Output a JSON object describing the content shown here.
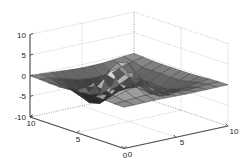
{
  "figure": {
    "title": "",
    "background_color": "#ffffff",
    "axis_color": "#4d4d4d",
    "grid_color": "#9a9a9a",
    "mesh_color": "#3a3a3a",
    "tick_font_size": 8
  },
  "chart_data": {
    "type": "surface",
    "title": "",
    "xlabel": "",
    "ylabel": "",
    "zlabel": "",
    "function": "peaks",
    "grid_n": 11,
    "xlim": [
      0,
      10
    ],
    "ylim": [
      0,
      10
    ],
    "zlim": [
      -10,
      10
    ],
    "xticks": [
      0,
      5,
      10
    ],
    "yticks": [
      0,
      5,
      10
    ],
    "zticks": [
      -10,
      -5,
      0,
      5,
      10
    ],
    "xtick_labels": [
      "0",
      "5",
      "10"
    ],
    "ytick_labels": [
      "10",
      "5",
      "0"
    ],
    "ztick_labels": [
      "10",
      "5",
      "0",
      "-5",
      "-10"
    ],
    "grid": true,
    "legend": null,
    "colormap": "gray",
    "view_azimuth": -37.5,
    "view_elevation": 30,
    "x": [
      0,
      1,
      2,
      3,
      4,
      5,
      6,
      7,
      8,
      9,
      10
    ],
    "y": [
      0,
      1,
      2,
      3,
      4,
      5,
      6,
      7,
      8,
      9,
      10
    ],
    "z": [
      [
        0.01,
        0.03,
        0.07,
        0.1,
        0.07,
        0.0,
        -0.06,
        -0.07,
        -0.05,
        -0.02,
        -0.01
      ],
      [
        0.05,
        0.17,
        0.39,
        0.53,
        0.37,
        0.01,
        -0.31,
        -0.39,
        -0.26,
        -0.11,
        -0.03
      ],
      [
        0.17,
        0.58,
        1.35,
        1.9,
        1.38,
        0.09,
        -1.06,
        -1.38,
        -0.94,
        -0.4,
        -0.12
      ],
      [
        0.33,
        1.19,
        2.97,
        4.52,
        3.6,
        0.53,
        -2.26,
        -3.16,
        -2.22,
        -0.96,
        -0.29
      ],
      [
        0.36,
        1.37,
        3.7,
        6.21,
        5.53,
        1.33,
        -2.74,
        -4.15,
        -3.02,
        -1.33,
        -0.4
      ],
      [
        0.13,
        0.53,
        1.63,
        3.18,
        3.33,
        0.64,
        -2.6,
        -4.2,
        -3.19,
        -1.43,
        -0.44
      ],
      [
        -0.2,
        -0.8,
        -2.25,
        -3.57,
        -3.12,
        -1.68,
        -2.18,
        -3.49,
        -2.81,
        -1.3,
        -0.4
      ],
      [
        -0.34,
        -1.33,
        -3.53,
        -5.88,
        -6.62,
        -5.52,
        -4.56,
        -4.43,
        -3.05,
        -1.35,
        -0.41
      ],
      [
        -0.24,
        -0.92,
        -2.43,
        -4.16,
        -5.24,
        -5.43,
        -5.05,
        -4.43,
        -2.91,
        -1.27,
        -0.38
      ],
      [
        -0.1,
        -0.37,
        -0.98,
        -1.72,
        -2.3,
        -2.57,
        -2.53,
        -2.28,
        -1.52,
        -0.66,
        -0.2
      ],
      [
        -0.03,
        -0.1,
        -0.28,
        -0.5,
        -0.69,
        -0.8,
        -0.81,
        -0.74,
        -0.5,
        -0.22,
        -0.07
      ]
    ],
    "zmin": -6.62,
    "zmax": 6.21,
    "peak_high_value": 6.21,
    "peak_low_value": -6.62
  },
  "axes": {
    "z_ticks": [
      {
        "label": "10",
        "value": 10
      },
      {
        "label": "5",
        "value": 5
      },
      {
        "label": "0",
        "value": 0
      },
      {
        "label": "-5",
        "value": -5
      },
      {
        "label": "-10",
        "value": -10
      }
    ],
    "y_ticks": [
      {
        "label": "10",
        "value": 10
      },
      {
        "label": "5",
        "value": 5
      },
      {
        "label": "0",
        "value": 0
      }
    ],
    "x_ticks": [
      {
        "label": "0",
        "value": 0
      },
      {
        "label": "5",
        "value": 5
      },
      {
        "label": "10",
        "value": 10
      }
    ]
  }
}
